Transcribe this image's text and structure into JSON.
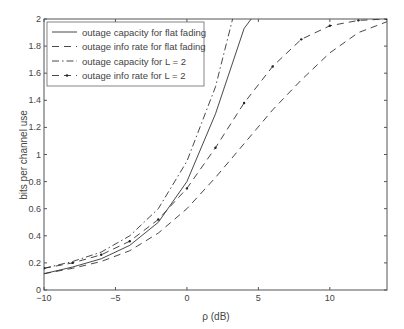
{
  "chart_data": {
    "type": "line",
    "title": "",
    "xlabel": "ρ (dB)",
    "ylabel": "bits per channel use",
    "xlim": [
      -10,
      14
    ],
    "ylim": [
      0,
      2
    ],
    "xticks": [
      -10,
      -5,
      0,
      5,
      10
    ],
    "yticks": [
      0,
      0.2,
      0.4,
      0.6,
      0.8,
      1,
      1.2,
      1.4,
      1.6,
      1.8,
      2
    ],
    "grid": false,
    "legend_position": "upper left",
    "series": [
      {
        "name": "outage capacity for flat fading",
        "style": "solid",
        "x": [
          -10,
          -8,
          -6,
          -4,
          -2,
          0,
          2,
          4,
          4.5
        ],
        "y": [
          0.12,
          0.17,
          0.23,
          0.33,
          0.5,
          0.8,
          1.3,
          1.93,
          2.0
        ]
      },
      {
        "name": "outage info rate for flat fading",
        "style": "dashed",
        "x": [
          -10,
          -8,
          -6,
          -4,
          -2,
          0,
          2,
          4,
          6,
          8,
          10,
          12,
          14
        ],
        "y": [
          0.12,
          0.16,
          0.21,
          0.29,
          0.42,
          0.6,
          0.83,
          1.08,
          1.33,
          1.55,
          1.75,
          1.9,
          1.98
        ]
      },
      {
        "name": "outage capacity for L = 2",
        "style": "dashdot",
        "x": [
          -10,
          -8,
          -6,
          -4,
          -2,
          0,
          2,
          3.2
        ],
        "y": [
          0.16,
          0.21,
          0.28,
          0.4,
          0.6,
          0.95,
          1.5,
          2.0
        ]
      },
      {
        "name": "outage info rate for L = 2",
        "style": "dashed-dot-markers",
        "x": [
          -10,
          -8,
          -6,
          -4,
          -2,
          0,
          2,
          4,
          6,
          8,
          10,
          12,
          14
        ],
        "y": [
          0.16,
          0.2,
          0.26,
          0.36,
          0.52,
          0.75,
          1.05,
          1.38,
          1.65,
          1.85,
          1.95,
          1.99,
          2.0
        ]
      }
    ]
  }
}
